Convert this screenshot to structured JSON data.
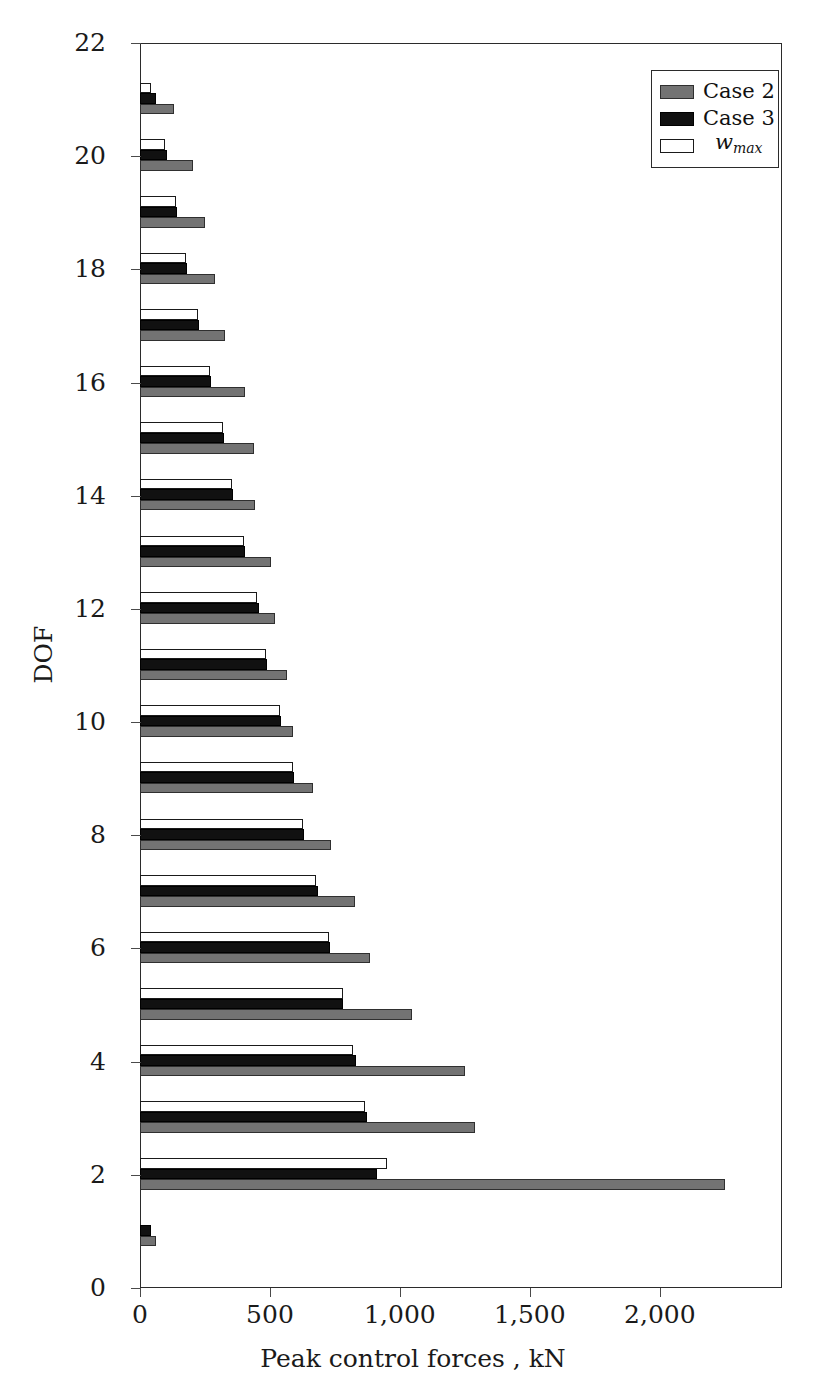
{
  "chart_data": {
    "type": "bar",
    "orientation": "horizontal",
    "title": "",
    "xlabel": "Peak control forces , kN",
    "ylabel": "DOF",
    "xlim": [
      0,
      2470
    ],
    "ylim": [
      0,
      22
    ],
    "xticks": [
      0,
      500,
      1000,
      1500,
      2000
    ],
    "xticklabels": [
      "0",
      "500",
      "1,000",
      "1,500",
      "2,000"
    ],
    "yticks": [
      0,
      2,
      4,
      6,
      8,
      10,
      12,
      14,
      16,
      18,
      20,
      22
    ],
    "yticklabels": [
      "0",
      "2",
      "4",
      "6",
      "8",
      "10",
      "12",
      "14",
      "16",
      "18",
      "20",
      "22"
    ],
    "grid": false,
    "legend_position": "upper right",
    "categories": [
      1,
      2,
      3,
      4,
      5,
      6,
      7,
      8,
      9,
      10,
      11,
      12,
      13,
      14,
      15,
      16,
      17,
      18,
      19,
      20,
      21
    ],
    "series": [
      {
        "name": "Case 2",
        "color": "#737373",
        "values": [
          62,
          2250,
          1288,
          1250,
          1046,
          885,
          827,
          735,
          665,
          588,
          565,
          519,
          504,
          442,
          438,
          404,
          327,
          288,
          250,
          204,
          131
        ]
      },
      {
        "name": "Case 3",
        "color": "#111111",
        "values": [
          42,
          912,
          873,
          831,
          781,
          731,
          685,
          631,
          592,
          542,
          488,
          458,
          404,
          358,
          323,
          273,
          227,
          181,
          142,
          104,
          62
        ]
      },
      {
        "name": "w_max",
        "color": "#ffffff",
        "values": [
          0,
          950,
          865,
          819,
          781,
          727,
          677,
          627,
          588,
          538,
          485,
          450,
          400,
          354,
          319,
          269,
          223,
          177,
          138,
          96,
          42
        ]
      }
    ]
  },
  "legend": {
    "entries": [
      {
        "label": "Case 2",
        "swatch": "case2"
      },
      {
        "label": "Case 3",
        "swatch": "case3"
      },
      {
        "label": "w",
        "sub": "max",
        "swatch": "wmax"
      }
    ]
  },
  "axes": {
    "x_axis_label": "Peak control forces , kN",
    "y_axis_label": "DOF"
  }
}
